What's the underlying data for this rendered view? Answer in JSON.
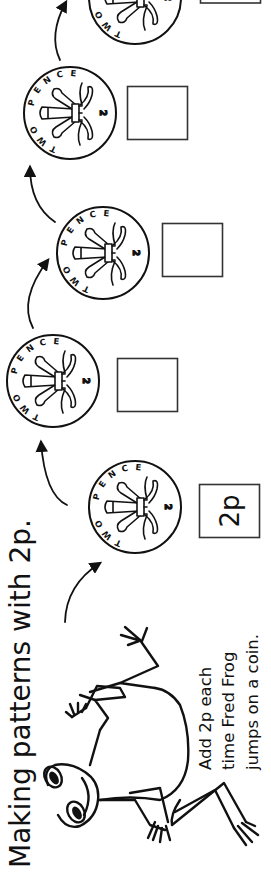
{
  "worksheet": {
    "title": "Making patterns with 2p.",
    "instructions": {
      "line1": "Add 2p each",
      "line2": "time Fred Frog",
      "line3": "jumps on a coin."
    },
    "character": "Fred Frog",
    "coin": {
      "label_top": "PENCE",
      "label_bottom": "TWO",
      "numeral": "2"
    },
    "steps": [
      {
        "answer": "2p"
      },
      {
        "answer": ""
      },
      {
        "answer": ""
      },
      {
        "answer": ""
      },
      {
        "answer": ""
      }
    ],
    "colors": {
      "ink": "#111111",
      "paper": "#ffffff",
      "box_border": "#333333"
    }
  }
}
